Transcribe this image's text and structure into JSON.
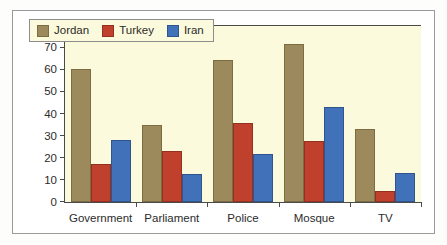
{
  "chart_data": {
    "type": "bar",
    "title": "",
    "xlabel": "",
    "ylabel": "",
    "categories": [
      "Government",
      "Parliament",
      "Police",
      "Mosque",
      "TV"
    ],
    "series": [
      {
        "name": "Jordan",
        "color": "#9d8a5c",
        "values": [
          60,
          35,
          64,
          71.5,
          33
        ]
      },
      {
        "name": "Turkey",
        "color": "#c0402e",
        "values": [
          17,
          23,
          35.5,
          27.5,
          5
        ]
      },
      {
        "name": "Iran",
        "color": "#4171b8",
        "values": [
          28,
          12.5,
          21.5,
          43,
          13
        ]
      }
    ],
    "ylim": [
      0,
      80
    ],
    "ytick_step": 10,
    "yticks": [
      0,
      10,
      20,
      30,
      40,
      50,
      60,
      70,
      80
    ],
    "ytick_labels": [
      "0",
      "10",
      "20",
      "30",
      "40",
      "50",
      "60",
      "70",
      "80"
    ],
    "grid": false,
    "legend_position": "top-left",
    "plot_background": "#fbfadc",
    "frame_color": "#9a9a9a",
    "axis_color": "#4a4a4a"
  }
}
